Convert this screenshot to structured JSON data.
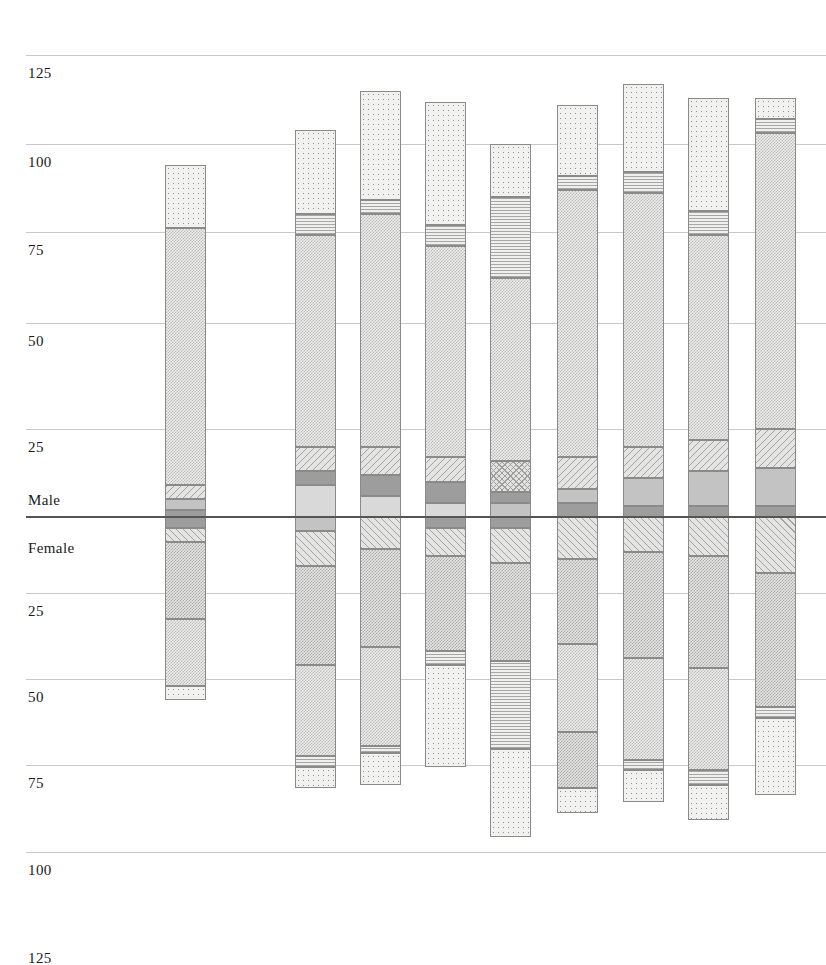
{
  "chart_data": {
    "type": "bar",
    "subtype": "population-pyramid-stacked",
    "title": "",
    "subtitle": "",
    "xlabel": "",
    "ylabel": "",
    "grid": true,
    "legend_position": "none",
    "axis": {
      "upper_label": "Male",
      "lower_label": "Female",
      "upper_ticks": [
        125,
        100,
        75,
        50,
        25
      ],
      "lower_ticks": [
        25,
        50,
        75,
        100,
        125
      ],
      "unit_px": 3.52,
      "baseline_px": 517,
      "ylim_upper": 130,
      "ylim_lower": 130
    },
    "tick_rows": [
      {
        "label": "125",
        "y": 55,
        "side": "male",
        "major": false
      },
      {
        "label": "100",
        "y": 144,
        "side": "male",
        "major": false
      },
      {
        "label": "75",
        "y": 232,
        "side": "male",
        "major": false
      },
      {
        "label": "50",
        "y": 323,
        "side": "male",
        "major": false
      },
      {
        "label": "25",
        "y": 429,
        "side": "male",
        "major": false
      },
      {
        "label": "Male",
        "y": 482,
        "side": "male",
        "major": false,
        "nogrid": true
      },
      {
        "label": "Female",
        "y": 530,
        "side": "female",
        "major": false,
        "nogrid": true
      },
      {
        "label": "25",
        "y": 593,
        "side": "female",
        "major": false
      },
      {
        "label": "50",
        "y": 679,
        "side": "female",
        "major": false
      },
      {
        "label": "75",
        "y": 765,
        "side": "female",
        "major": false
      },
      {
        "label": "100",
        "y": 852,
        "side": "female",
        "major": false
      },
      {
        "label": "125",
        "y": 940,
        "side": "female",
        "major": false,
        "nogrid": true
      }
    ],
    "categories": [
      "1",
      "2",
      "3",
      "4",
      "5",
      "6",
      "7",
      "8",
      "9",
      "10"
    ],
    "male_totals": [
      103,
      110,
      117,
      120,
      113,
      118,
      123,
      119,
      121,
      0
    ],
    "female_totals": [
      51,
      77,
      72,
      83,
      94,
      84,
      81,
      86,
      79,
      0
    ],
    "bars": [
      {
        "index": 1,
        "x": 165,
        "w": 41,
        "male_segments": [
          {
            "value": 18,
            "fill": "dotSparse"
          },
          {
            "value": 73,
            "fill": "checkLight"
          },
          {
            "value": 4,
            "fill": "diagDown"
          },
          {
            "value": 3,
            "fill": "solidMid"
          },
          {
            "value": 2,
            "fill": "solidDark"
          }
        ],
        "female_segments": [
          {
            "value": 3,
            "fill": "solidDark"
          },
          {
            "value": 4,
            "fill": "diagUp"
          },
          {
            "value": 22,
            "fill": "checkMed"
          },
          {
            "value": 19,
            "fill": "checkLight"
          },
          {
            "value": 4,
            "fill": "dotSparse"
          }
        ]
      },
      {
        "index": 2,
        "x": 295,
        "w": 41,
        "male_segments": [
          {
            "value": 24,
            "fill": "dotSparse"
          },
          {
            "value": 6,
            "fill": "hline"
          },
          {
            "value": 60,
            "fill": "checkLight"
          },
          {
            "value": 7,
            "fill": "diagDown"
          },
          {
            "value": 4,
            "fill": "solidDark"
          },
          {
            "value": 9,
            "fill": "solidLight"
          }
        ],
        "female_segments": [
          {
            "value": 4,
            "fill": "solidMid"
          },
          {
            "value": 10,
            "fill": "diagUp"
          },
          {
            "value": 28,
            "fill": "checkMed"
          },
          {
            "value": 26,
            "fill": "checkLight"
          },
          {
            "value": 3,
            "fill": "hline"
          },
          {
            "value": 6,
            "fill": "dotSparse"
          }
        ]
      },
      {
        "index": 3,
        "x": 360,
        "w": 41,
        "male_segments": [
          {
            "value": 31,
            "fill": "dotSparse"
          },
          {
            "value": 4,
            "fill": "hline"
          },
          {
            "value": 66,
            "fill": "checkLight"
          },
          {
            "value": 8,
            "fill": "diagDown"
          },
          {
            "value": 6,
            "fill": "solidDark"
          },
          {
            "value": 6,
            "fill": "solidLight"
          }
        ],
        "female_segments": [
          {
            "value": 9,
            "fill": "diagUp"
          },
          {
            "value": 28,
            "fill": "checkMed"
          },
          {
            "value": 28,
            "fill": "checkLight"
          },
          {
            "value": 2,
            "fill": "hline"
          },
          {
            "value": 9,
            "fill": "dotSparse"
          }
        ]
      },
      {
        "index": 4,
        "x": 425,
        "w": 41,
        "male_segments": [
          {
            "value": 35,
            "fill": "dotSparse"
          },
          {
            "value": 6,
            "fill": "hline"
          },
          {
            "value": 60,
            "fill": "checkLight"
          },
          {
            "value": 7,
            "fill": "diagDown"
          },
          {
            "value": 6,
            "fill": "solidDark"
          },
          {
            "value": 4,
            "fill": "solidLight"
          }
        ],
        "female_segments": [
          {
            "value": 3,
            "fill": "solidDark"
          },
          {
            "value": 8,
            "fill": "diagUp"
          },
          {
            "value": 27,
            "fill": "checkMed"
          },
          {
            "value": 4,
            "fill": "hline"
          },
          {
            "value": 29,
            "fill": "dotSparse"
          }
        ]
      },
      {
        "index": 5,
        "x": 490,
        "w": 41,
        "male_segments": [
          {
            "value": 15,
            "fill": "dotSparse"
          },
          {
            "value": 23,
            "fill": "hline"
          },
          {
            "value": 52,
            "fill": "checkLight"
          },
          {
            "value": 9,
            "fill": "xhatch"
          },
          {
            "value": 3,
            "fill": "solidDark"
          },
          {
            "value": 4,
            "fill": "solidMid"
          }
        ],
        "female_segments": [
          {
            "value": 3,
            "fill": "solidDark"
          },
          {
            "value": 10,
            "fill": "diagUp"
          },
          {
            "value": 28,
            "fill": "checkMed"
          },
          {
            "value": 25,
            "fill": "hline"
          },
          {
            "value": 25,
            "fill": "dotSparse"
          }
        ]
      },
      {
        "index": 6,
        "x": 557,
        "w": 41,
        "male_segments": [
          {
            "value": 20,
            "fill": "dotSparse"
          },
          {
            "value": 4,
            "fill": "hline"
          },
          {
            "value": 76,
            "fill": "checkLight"
          },
          {
            "value": 9,
            "fill": "diagDown"
          },
          {
            "value": 4,
            "fill": "solidMid"
          },
          {
            "value": 4,
            "fill": "solidDark"
          }
        ],
        "female_segments": [
          {
            "value": 12,
            "fill": "diagUp"
          },
          {
            "value": 24,
            "fill": "checkMed"
          },
          {
            "value": 25,
            "fill": "checkLight"
          },
          {
            "value": 16,
            "fill": "checkMed"
          },
          {
            "value": 7,
            "fill": "dotSparse"
          }
        ]
      },
      {
        "index": 7,
        "x": 623,
        "w": 41,
        "male_segments": [
          {
            "value": 25,
            "fill": "dotSparse"
          },
          {
            "value": 6,
            "fill": "hline"
          },
          {
            "value": 72,
            "fill": "checkLight"
          },
          {
            "value": 9,
            "fill": "diagDown"
          },
          {
            "value": 8,
            "fill": "solidMid"
          },
          {
            "value": 3,
            "fill": "solidDark"
          }
        ],
        "female_segments": [
          {
            "value": 10,
            "fill": "diagUp"
          },
          {
            "value": 30,
            "fill": "checkMed"
          },
          {
            "value": 29,
            "fill": "checkLight"
          },
          {
            "value": 3,
            "fill": "hline"
          },
          {
            "value": 9,
            "fill": "dotSparse"
          }
        ]
      },
      {
        "index": 8,
        "x": 688,
        "w": 41,
        "male_segments": [
          {
            "value": 32,
            "fill": "dotSparse"
          },
          {
            "value": 7,
            "fill": "hline"
          },
          {
            "value": 58,
            "fill": "checkLight"
          },
          {
            "value": 9,
            "fill": "diagDown"
          },
          {
            "value": 10,
            "fill": "solidMid"
          },
          {
            "value": 3,
            "fill": "solidDark"
          }
        ],
        "female_segments": [
          {
            "value": 11,
            "fill": "diagUp"
          },
          {
            "value": 32,
            "fill": "checkMed"
          },
          {
            "value": 29,
            "fill": "checkLight"
          },
          {
            "value": 4,
            "fill": "hline"
          },
          {
            "value": 10,
            "fill": "dotSparse"
          }
        ]
      },
      {
        "index": 9,
        "x": 755,
        "w": 41,
        "male_segments": [
          {
            "value": 6,
            "fill": "dotSparse"
          },
          {
            "value": 4,
            "fill": "hline"
          },
          {
            "value": 84,
            "fill": "checkLight"
          },
          {
            "value": 11,
            "fill": "diagDown"
          },
          {
            "value": 11,
            "fill": "solidMid"
          },
          {
            "value": 3,
            "fill": "solidDark"
          }
        ],
        "female_segments": [
          {
            "value": 16,
            "fill": "diagUp"
          },
          {
            "value": 38,
            "fill": "checkMed"
          },
          {
            "value": 3,
            "fill": "hline"
          },
          {
            "value": 22,
            "fill": "dotSparse"
          }
        ]
      }
    ]
  }
}
